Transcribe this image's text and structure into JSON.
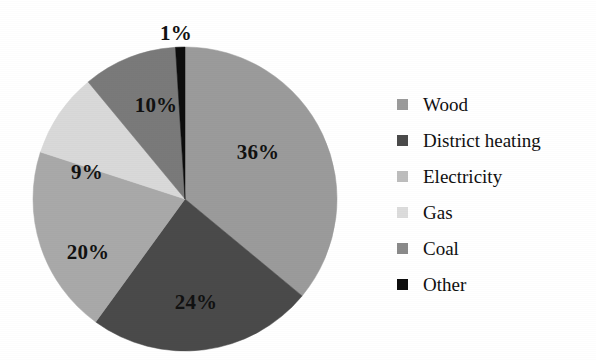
{
  "chart_data": {
    "type": "pie",
    "title": "",
    "subtitle": "",
    "xlabel": "",
    "ylabel": "",
    "legend_position": "right",
    "grid": false,
    "units": "percent",
    "start_angle_deg": 0,
    "direction": "clockwise",
    "categories": [
      "Wood",
      "District heating",
      "Electricity",
      "Gas",
      "Coal",
      "Other"
    ],
    "values": [
      36,
      24,
      20,
      9,
      10,
      1
    ],
    "data_labels": [
      "36%",
      "24%",
      "20%",
      "9%",
      "10%",
      "1%"
    ],
    "colors": [
      "#9b9b9b",
      "#4a4a4a",
      "#a9a9a9",
      "#d9d9d9",
      "#7a7a7a",
      "#0d0d0d"
    ],
    "slices": [
      {
        "label": "Wood",
        "value": 36,
        "data_label": "36%",
        "color": "#9b9b9b",
        "label_x": 258,
        "label_y": 152
      },
      {
        "label": "District heating",
        "value": 24,
        "data_label": "24%",
        "color": "#4a4a4a",
        "label_x": 196,
        "label_y": 302
      },
      {
        "label": "Electricity",
        "value": 20,
        "data_label": "20%",
        "color": "#a9a9a9",
        "label_x": 88,
        "label_y": 252
      },
      {
        "label": "Gas",
        "value": 9,
        "data_label": "9%",
        "color": "#d9d9d9",
        "label_x": 87,
        "label_y": 172
      },
      {
        "label": "Coal",
        "value": 10,
        "data_label": "10%",
        "color": "#7a7a7a",
        "label_x": 156,
        "label_y": 105
      },
      {
        "label": "Other",
        "value": 1,
        "data_label": "1%",
        "color": "#0d0d0d",
        "label_x": 176,
        "label_y": 33
      }
    ]
  },
  "legend": {
    "items": [
      {
        "label": "Wood",
        "color": "#9b9b9b"
      },
      {
        "label": "District heating",
        "color": "#4a4a4a"
      },
      {
        "label": "Electricity",
        "color": "#bdbdbd"
      },
      {
        "label": "Gas",
        "color": "#dcdcdc"
      },
      {
        "label": "Coal",
        "color": "#8a8a8a"
      },
      {
        "label": "Other",
        "color": "#0d0d0d"
      }
    ]
  },
  "figure": {
    "background": "#ffffff",
    "pie_center_x": 185,
    "pie_center_y": 199,
    "pie_radius": 152
  }
}
